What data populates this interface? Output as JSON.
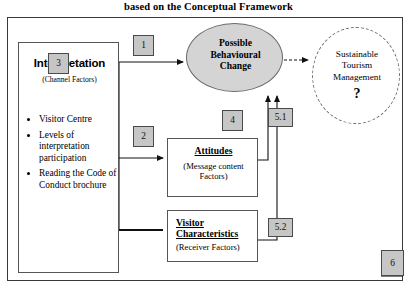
{
  "title": "based on the Conceptual Framework",
  "interpretation": {
    "heading": "Interpretation",
    "subheading": "(Channel Factors)",
    "badge": "3",
    "bullets": [
      "Visitor Centre",
      "Levels of interpretation participation",
      "Reading the Code of Conduct brochure"
    ]
  },
  "possible_change": {
    "label": "Possible\nBehavioural\nChange",
    "line1": "Possible",
    "line2": "Behavioural",
    "line3": "Change",
    "fill_color": "#d4d4d4"
  },
  "sustainable": {
    "line1": "Sustainable",
    "line2": "Tourism",
    "line3": "Management",
    "question": "?"
  },
  "attitudes": {
    "heading": "Attitudes",
    "subheading": "(Message content Factors)",
    "badge": "4"
  },
  "visitor_characteristics": {
    "heading_line1": "Visitor",
    "heading_line2": "Characteristics",
    "subheading": "(Receiver Factors)",
    "badge": "5.2"
  },
  "badges": {
    "one": "1",
    "two": "2",
    "five_one": "5.1",
    "six": "6"
  },
  "colors": {
    "badge_fill": "#c6c6c6",
    "badge_border": "#4a4a4a",
    "frame_border": "#3a3a3a",
    "ellipse_fill": "#d4d4d4"
  }
}
